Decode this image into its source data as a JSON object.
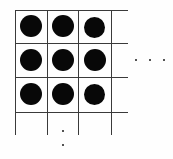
{
  "figure": {
    "title": "Infinite square lattice of filled circles",
    "description": "A 3 by 3 portion of a square grid, each cell containing a solid black disk, with grid lines and ellipses indicating the pattern continues to the right and downward.",
    "canvas": {
      "width": 173,
      "height": 159,
      "background_color": "#fefefe"
    },
    "style": {
      "line_color": "#3a3a3a",
      "line_width": 1,
      "dot_color": "#080808",
      "ellipsis_color": "#1a1a1a"
    },
    "grid": {
      "visible_rows": 3,
      "visible_columns": 3,
      "cell_width": 32,
      "cell_height": 34,
      "origin_x": 15,
      "origin_y": 10,
      "horizontal_lines": [
        {
          "label": "row-line-0",
          "y": 10,
          "x_start": 15,
          "x_end": 128
        },
        {
          "label": "row-line-1",
          "y": 43,
          "x_start": 15,
          "x_end": 128
        },
        {
          "label": "row-line-2",
          "y": 77,
          "x_start": 15,
          "x_end": 128
        },
        {
          "label": "row-line-3",
          "y": 112,
          "x_start": 15,
          "x_end": 128
        }
      ],
      "vertical_lines": [
        {
          "label": "col-line-0",
          "x": 15,
          "y_start": 10,
          "y_end": 135
        },
        {
          "label": "col-line-1",
          "x": 47,
          "y_start": 10,
          "y_end": 135
        },
        {
          "label": "col-line-2",
          "x": 78,
          "y_start": 10,
          "y_end": 135
        },
        {
          "label": "col-line-3",
          "x": 111,
          "y_start": 10,
          "y_end": 135
        }
      ]
    },
    "circles": [
      {
        "label": "dot-r0-c0",
        "row": 0,
        "col": 0,
        "cx": 31,
        "cy": 26,
        "diameter": 22
      },
      {
        "label": "dot-r0-c1",
        "row": 0,
        "col": 1,
        "cx": 63,
        "cy": 26,
        "diameter": 22
      },
      {
        "label": "dot-r0-c2",
        "row": 0,
        "col": 2,
        "cx": 94,
        "cy": 27,
        "diameter": 21
      },
      {
        "label": "dot-r1-c0",
        "row": 1,
        "col": 0,
        "cx": 31,
        "cy": 60,
        "diameter": 22
      },
      {
        "label": "dot-r1-c1",
        "row": 1,
        "col": 1,
        "cx": 63,
        "cy": 60,
        "diameter": 22
      },
      {
        "label": "dot-r1-c2",
        "row": 1,
        "col": 2,
        "cx": 95,
        "cy": 60,
        "diameter": 22
      },
      {
        "label": "dot-r2-c0",
        "row": 2,
        "col": 0,
        "cx": 31,
        "cy": 94,
        "diameter": 22
      },
      {
        "label": "dot-r2-c1",
        "row": 2,
        "col": 1,
        "cx": 63,
        "cy": 94,
        "diameter": 22
      },
      {
        "label": "dot-r2-c2",
        "row": 2,
        "col": 2,
        "cx": 94,
        "cy": 94,
        "diameter": 21
      }
    ],
    "ellipsis_horizontal": {
      "label": "continues to the right",
      "dots": [
        {
          "x": 136,
          "y": 60
        },
        {
          "x": 150,
          "y": 60
        },
        {
          "x": 164,
          "y": 60
        }
      ]
    },
    "ellipsis_vertical": {
      "label": "continues downward",
      "dots": [
        {
          "x": 63,
          "y": 131
        },
        {
          "x": 63,
          "y": 145
        }
      ]
    }
  }
}
